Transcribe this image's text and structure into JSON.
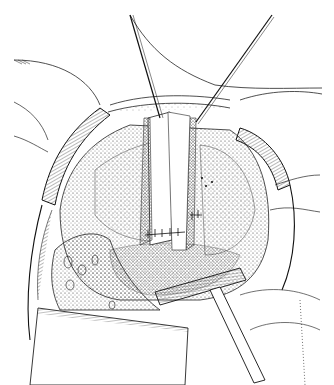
{
  "illustration": {
    "kind": "surgical line illustration",
    "style": "black ink stipple and hatching on white",
    "text_visible": false,
    "colors": {
      "background": "#ffffff",
      "ink": "#1a1a1a",
      "stipple": "#333333"
    },
    "elements": [
      {
        "name": "left-traction-suture",
        "description": "thin instrument/suture line entering from top center-left"
      },
      {
        "name": "right-traction-suture",
        "description": "thin instrument line entering from top right"
      },
      {
        "name": "retractor-blades",
        "description": "curved hatched retractor blades around circular opening"
      },
      {
        "name": "opened-cavity",
        "description": "stippled tissue cavity in center"
      },
      {
        "name": "tubular-flap",
        "description": "vertical tubular tissue flap with stitched edges"
      },
      {
        "name": "suture-line",
        "description": "row of interrupted sutures across lower cavity"
      },
      {
        "name": "hand-retractor",
        "description": "T-shaped hand-held retractor at lower right"
      },
      {
        "name": "lower-drape",
        "description": "hatched drape/sponge block at lower left"
      }
    ]
  }
}
